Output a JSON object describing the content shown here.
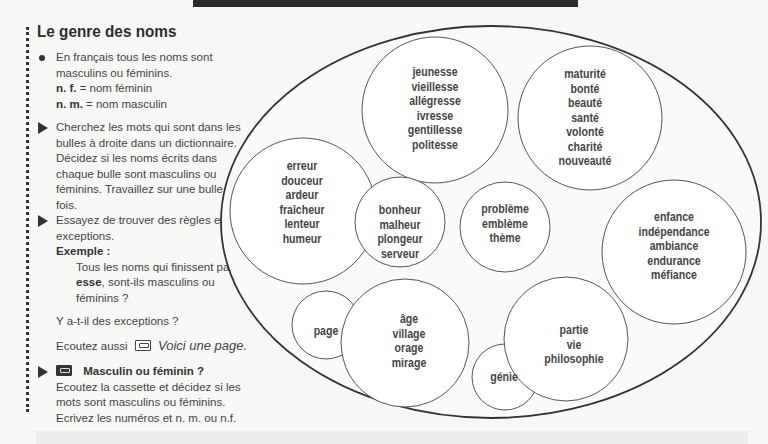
{
  "header": {
    "title": "Le genre des noms"
  },
  "instructions": {
    "intro_line1": "En français tous les noms sont",
    "intro_line2": "masculins ou féminins.",
    "nf_abbr": "n. f.",
    "nf_def": "= nom féminin",
    "nm_abbr": "n. m.",
    "nm_def": "= nom masculin",
    "task1": "Cherchez les mots qui sont dans les bulles à droite dans un dictionnaire. Décidez si les noms écrits dans chaque bulle sont masculins ou féminins. Travaillez sur une bulle à la fois.",
    "task2": "Essayez de trouver des règles et des exceptions.",
    "example_label": "Exemple :",
    "example_pre": "Tous les noms qui finissent par ",
    "example_bold": "-esse",
    "example_post": ", sont-ils masculins ou féminins ?",
    "exceptions_question": "Y a-t-il des exceptions ?",
    "listen_also": "Ecoutez aussi",
    "listen_also_title": "Voici une page.",
    "task3_title": "Masculin ou féminin ?",
    "task3_body": "Ecoutez la cassette et décidez si les mots sont masculins ou féminins. Ecrivez les numéros et n. m. ou n.f."
  },
  "icons": {
    "cassette_outline": "cassette-icon",
    "cassette_filled": "cassette-icon-filled"
  },
  "bubbles": [
    {
      "id": "esse",
      "words": [
        "jeunesse",
        "vieillesse",
        "allégresse",
        "ivresse",
        "gentillesse",
        "politesse"
      ]
    },
    {
      "id": "te",
      "words": [
        "maturité",
        "bonté",
        "beauté",
        "santé",
        "volonté",
        "charité",
        "nouveauté"
      ]
    },
    {
      "id": "eur-f",
      "words": [
        "erreur",
        "douceur",
        "ardeur",
        "fraîcheur",
        "lenteur",
        "humeur"
      ]
    },
    {
      "id": "eur-m",
      "words": [
        "bonheur",
        "malheur",
        "plongeur",
        "serveur"
      ]
    },
    {
      "id": "eme",
      "words": [
        "problème",
        "emblème",
        "thème"
      ]
    },
    {
      "id": "ance",
      "words": [
        "enfance",
        "indépendance",
        "ambiance",
        "endurance",
        "méfiance"
      ]
    },
    {
      "id": "page",
      "words": [
        "page"
      ]
    },
    {
      "id": "age",
      "words": [
        "âge",
        "village",
        "orage",
        "mirage"
      ]
    },
    {
      "id": "ie",
      "words": [
        "partie",
        "vie",
        "philosophie"
      ]
    },
    {
      "id": "genie",
      "words": [
        "génie"
      ]
    }
  ]
}
